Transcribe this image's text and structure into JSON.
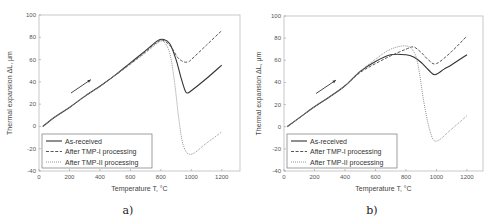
{
  "chart_data": [
    {
      "type": "line",
      "panel_label": "a)",
      "title": "",
      "xlabel": "Temperature T, °C",
      "ylabel": "Thermal expansion ΔL, μm",
      "xlim": [
        0,
        1320
      ],
      "ylim": [
        -40,
        100
      ],
      "xticks": [
        0,
        200,
        400,
        600,
        800,
        1000,
        1200
      ],
      "yticks": [
        -40,
        -20,
        0,
        20,
        40,
        60,
        80,
        100
      ],
      "grid": false,
      "legend_position": "lower left",
      "annotations": [
        {
          "type": "arrow",
          "from": [
            210,
            30
          ],
          "to": [
            340,
            42
          ],
          "label": "heating direction"
        }
      ],
      "series": [
        {
          "name": "As-received",
          "style": "solid",
          "color": "#333333",
          "x": [
            25,
            100,
            200,
            300,
            400,
            500,
            600,
            700,
            780,
            820,
            860,
            900,
            930,
            960,
            975,
            1000,
            1100,
            1200
          ],
          "y": [
            0,
            8,
            17,
            27,
            36,
            46,
            57,
            68,
            77,
            78,
            74,
            60,
            45,
            32,
            30,
            32,
            43,
            55
          ]
        },
        {
          "name": "After TMP-I processing",
          "style": "dashed",
          "color": "#555555",
          "x": [
            25,
            100,
            200,
            300,
            400,
            500,
            600,
            700,
            780,
            820,
            870,
            910,
            950,
            980,
            1000,
            1100,
            1200
          ],
          "y": [
            0,
            8,
            17,
            27,
            36,
            46,
            56,
            67,
            76,
            77,
            71,
            62,
            58,
            58,
            60,
            73,
            86
          ]
        },
        {
          "name": "After TMP-II processing",
          "style": "dotted",
          "color": "#888888",
          "x": [
            25,
            100,
            200,
            300,
            400,
            500,
            600,
            700,
            780,
            820,
            860,
            890,
            920,
            950,
            1000,
            1100,
            1200
          ],
          "y": [
            0,
            8,
            17,
            27,
            36,
            46,
            56,
            66,
            75,
            76,
            65,
            40,
            5,
            -18,
            -25,
            -15,
            -5
          ]
        }
      ]
    },
    {
      "type": "line",
      "panel_label": "b)",
      "title": "",
      "xlabel": "Temperature T, °C",
      "ylabel": "Thermal expansion ΔL, μm",
      "xlim": [
        0,
        1305
      ],
      "ylim": [
        -40,
        100
      ],
      "xticks": [
        0,
        200,
        400,
        600,
        800,
        1000,
        1200
      ],
      "yticks": [
        -40,
        -20,
        0,
        20,
        40,
        60,
        80,
        100
      ],
      "grid": false,
      "legend_position": "lower left",
      "annotations": [
        {
          "type": "arrow",
          "from": [
            210,
            30
          ],
          "to": [
            340,
            42
          ],
          "label": "heating direction"
        }
      ],
      "series": [
        {
          "name": "As-received",
          "style": "solid",
          "color": "#333333",
          "x": [
            20,
            100,
            200,
            300,
            400,
            500,
            600,
            700,
            800,
            850,
            900,
            950,
            990,
            1050,
            1100,
            1200
          ],
          "y": [
            0,
            8,
            18,
            27,
            37,
            50,
            59,
            65,
            65,
            63,
            58,
            51,
            47,
            52,
            56,
            65
          ]
        },
        {
          "name": "After TMP-I processing",
          "style": "dashed",
          "color": "#555555",
          "x": [
            20,
            100,
            200,
            300,
            400,
            500,
            600,
            700,
            800,
            850,
            900,
            950,
            1000,
            1100,
            1200
          ],
          "y": [
            0,
            8,
            18,
            27,
            37,
            49,
            57,
            64,
            70,
            72,
            67,
            60,
            57,
            68,
            82
          ]
        },
        {
          "name": "After TMP-II processing",
          "style": "dotted",
          "color": "#888888",
          "x": [
            20,
            100,
            200,
            300,
            400,
            500,
            600,
            700,
            800,
            850,
            880,
            920,
            960,
            1000,
            1100,
            1200
          ],
          "y": [
            0,
            8,
            18,
            27,
            37,
            50,
            61,
            70,
            73,
            68,
            55,
            20,
            -5,
            -13,
            -2,
            10
          ]
        }
      ]
    }
  ],
  "labels": {
    "xlabel": "Temperature T, °C",
    "ylabel": "Thermal expansion ΔL, μm",
    "panel_a": "a)",
    "panel_b": "b)",
    "legend": [
      "As-received",
      "After TMP-I processing",
      "After TMP-II processing"
    ]
  }
}
